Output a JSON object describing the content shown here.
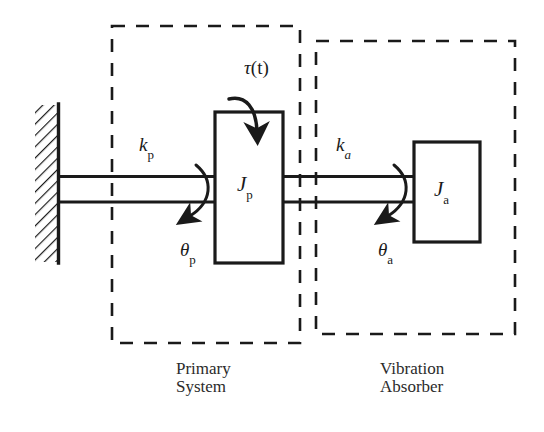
{
  "figure": {
    "type": "torsional-vibration-absorber-schematic",
    "background_color": "#ffffff",
    "line_color": "#1a1a1a",
    "text_color": "#1a1a1a"
  },
  "labels": {
    "torque": {
      "symbol": "τ",
      "argument": "(t)",
      "full": "τ(t)"
    },
    "spring_primary": {
      "symbol": "k",
      "subscript": "p",
      "full": "kₙ"
    },
    "spring_absorber": {
      "symbol": "k",
      "subscript": "a",
      "full": "kₐ"
    },
    "inertia_primary": {
      "symbol": "J",
      "subscript": "p",
      "full": "Jₙ"
    },
    "inertia_absorber": {
      "symbol": "J",
      "subscript": "a",
      "full": "Jₐ"
    },
    "angle_primary": {
      "symbol": "θ",
      "subscript": "p",
      "full": "θₙ"
    },
    "angle_absorber": {
      "symbol": "θ",
      "subscript": "a",
      "full": "θₐ"
    }
  },
  "groups": [
    {
      "id": "primary-system",
      "caption_line1": "Primary",
      "caption_line2": "System",
      "box": {
        "x": 112,
        "y": 26,
        "width": 188,
        "height": 317
      }
    },
    {
      "id": "vibration-absorber",
      "caption_line1": "Vibration",
      "caption_line2": "Absorber",
      "box": {
        "x": 316,
        "y": 41,
        "width": 199,
        "height": 293
      }
    }
  ],
  "components": {
    "wall": {
      "x": 35,
      "y": 105,
      "width": 23,
      "height": 157,
      "hatch_angle_deg": 45
    },
    "shaft_primary": {
      "x1": 58,
      "y1": 175,
      "x2": 215,
      "y2": 203
    },
    "shaft_absorber": {
      "x1": 283,
      "y1": 175,
      "x2": 414,
      "y2": 203
    },
    "block_primary": {
      "x": 215,
      "y": 112,
      "width": 68,
      "height": 151
    },
    "block_absorber": {
      "x": 414,
      "y": 142,
      "width": 66,
      "height": 100
    }
  }
}
